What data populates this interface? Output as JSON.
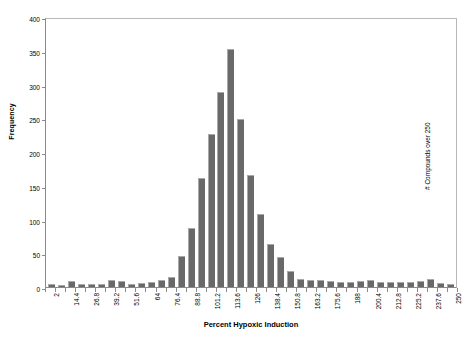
{
  "chart_data": {
    "type": "bar",
    "title": "",
    "xlabel": "Percent Hypoxic Induction",
    "ylabel": "Frequency",
    "ylim": [
      0,
      400
    ],
    "ytick_values": [
      0,
      50,
      100,
      150,
      200,
      250,
      300,
      350,
      400
    ],
    "ytick_labels": [
      "0",
      "50",
      "100",
      "150",
      "200",
      "250",
      "300",
      "350",
      "400"
    ],
    "grid": false,
    "legend": null,
    "bar_color": "#696969",
    "categories": [
      "2",
      "8.2",
      "14.4",
      "20.6",
      "26.8",
      "33",
      "39.2",
      "45.4",
      "51.6",
      "57.8",
      "64",
      "70.2",
      "76.4",
      "82.6",
      "88.8",
      "95",
      "101.2",
      "107.4",
      "113.6",
      "119.8",
      "126",
      "132.2",
      "138.4",
      "144.6",
      "150.8",
      "157",
      "163.2",
      "169.4",
      "175.6",
      "181.8",
      "188",
      "194.2",
      "200.4",
      "206.6",
      "212.8",
      "219",
      "225.2",
      "231.4",
      "237.6",
      "243.8",
      "250"
    ],
    "xtick_labels": [
      "2",
      "14.4",
      "26.8",
      "39.2",
      "51.6",
      "64",
      "76.4",
      "88.8",
      "101.2",
      "113.6",
      "126",
      "138.4",
      "150.8",
      "163.2",
      "175.6",
      "188",
      "200.4",
      "212.8",
      "225.2",
      "237.6",
      "250"
    ],
    "values": [
      4,
      3,
      9,
      5,
      5,
      4,
      10,
      9,
      4,
      6,
      7,
      10,
      15,
      46,
      88,
      162,
      227,
      289,
      353,
      249,
      166,
      108,
      64,
      44,
      24,
      12,
      10,
      10,
      9,
      8,
      7,
      9,
      10,
      8,
      7,
      8,
      8,
      9,
      12,
      6,
      5
    ],
    "annotation": "# Compounds over 250"
  }
}
